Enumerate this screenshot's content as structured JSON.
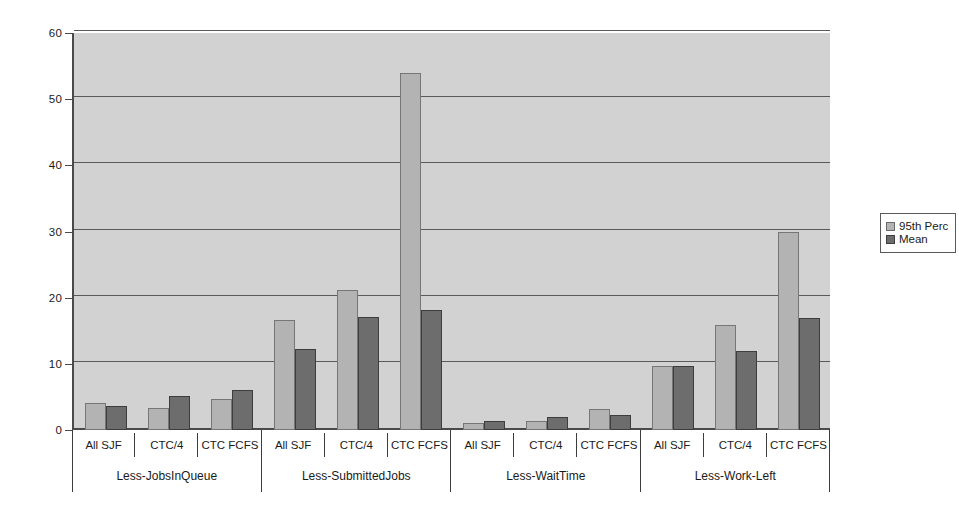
{
  "chart_data": {
    "type": "bar",
    "title": "",
    "xlabel": "",
    "ylabel": "",
    "ylim": [
      0,
      60
    ],
    "yticks": [
      0,
      10,
      20,
      30,
      40,
      50,
      60
    ],
    "grid": true,
    "legend_position": "right",
    "categories": [
      "All SJF",
      "CTC/4",
      "CTC FCFS"
    ],
    "groups": [
      {
        "label": "Less-JobsInQueue",
        "categories": [
          "All SJF",
          "CTC/4",
          "CTC FCFS"
        ],
        "95th Perc": [
          4.1,
          3.3,
          4.7
        ],
        "Mean": [
          3.7,
          5.2,
          6.0
        ]
      },
      {
        "label": "Less-SubmittedJobs",
        "categories": [
          "All SJF",
          "CTC/4",
          "CTC FCFS"
        ],
        "95th Perc": [
          16.7,
          21.1,
          53.9
        ],
        "Mean": [
          12.2,
          17.1,
          18.2
        ]
      },
      {
        "label": "Less-WaitTime",
        "categories": [
          "All SJF",
          "CTC/4",
          "CTC FCFS"
        ],
        "95th Perc": [
          1.0,
          1.4,
          3.2
        ],
        "Mean": [
          1.3,
          1.9,
          2.2
        ]
      },
      {
        "label": "Less-Work-Left",
        "categories": [
          "All SJF",
          "CTC/4",
          "CTC FCFS"
        ],
        "95th Perc": [
          9.7,
          15.9,
          29.9
        ],
        "Mean": [
          9.7,
          12.0,
          16.9
        ]
      }
    ],
    "series": [
      {
        "name": "95th Perc",
        "color": "#b3b3b3"
      },
      {
        "name": "Mean",
        "color": "#6d6d6d"
      }
    ],
    "colors": {
      "plot_background": "#d2d2d2",
      "page_background": "#ffffff",
      "gridline": "#5a5a5a",
      "axis": "#4a4a4a",
      "series_95th_perc": "#b3b3b3",
      "series_mean": "#6d6d6d"
    }
  },
  "legend": {
    "items": [
      {
        "label": "95th Perc",
        "swatch": "legend-swatch-95th-perc"
      },
      {
        "label": "Mean",
        "swatch": "legend-swatch-mean"
      }
    ]
  }
}
